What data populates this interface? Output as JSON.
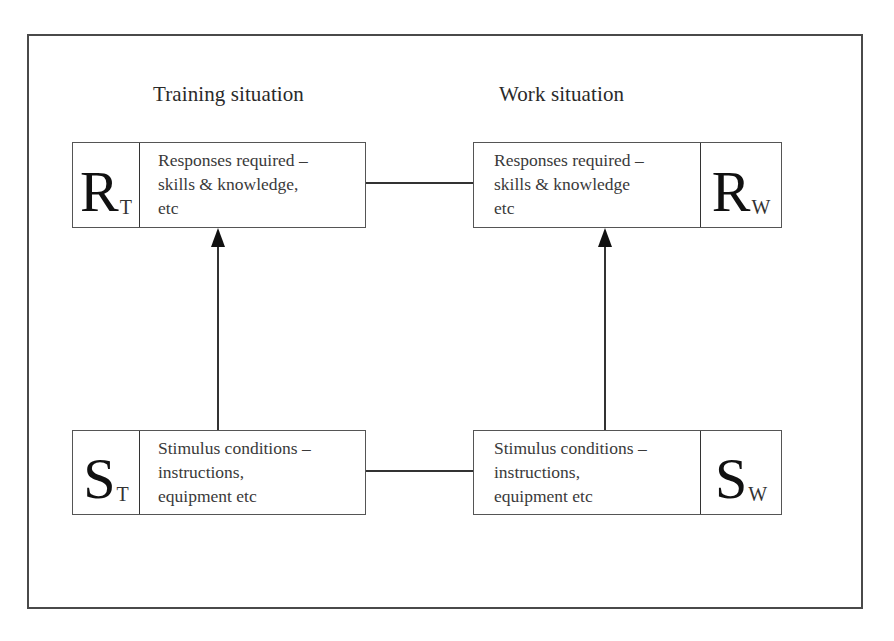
{
  "headings": {
    "training": "Training situation",
    "work": "Work situation"
  },
  "nodes": {
    "response_training": {
      "symbol": "R",
      "subscript": "T",
      "lines": [
        "Responses required –",
        "skills & knowledge,",
        "etc"
      ]
    },
    "response_work": {
      "symbol": "R",
      "subscript": "W",
      "lines": [
        "Responses required –",
        "skills & knowledge",
        "etc"
      ]
    },
    "stimulus_training": {
      "symbol": "S",
      "subscript": "T",
      "lines": [
        "Stimulus conditions –",
        "instructions,",
        "equipment etc"
      ]
    },
    "stimulus_work": {
      "symbol": "S",
      "subscript": "W",
      "lines": [
        "Stimulus conditions –",
        "instructions,",
        "equipment etc"
      ]
    }
  },
  "connections": [
    {
      "from": "stimulus_training",
      "to": "response_training",
      "type": "arrow"
    },
    {
      "from": "stimulus_work",
      "to": "response_work",
      "type": "arrow"
    },
    {
      "from": "response_training",
      "to": "response_work",
      "type": "line"
    },
    {
      "from": "stimulus_training",
      "to": "stimulus_work",
      "type": "line"
    }
  ],
  "colors": {
    "line": "#333333",
    "text": "#2a2a2a",
    "background": "#ffffff"
  }
}
